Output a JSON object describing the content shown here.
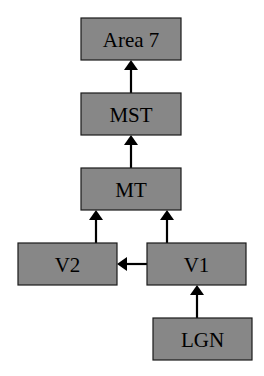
{
  "diagram": {
    "type": "flow",
    "title": "",
    "colors": {
      "node_fill": "#878787",
      "node_border": "#1a1a1a",
      "arrow": "#000000",
      "background": "#ffffff"
    },
    "nodes": [
      {
        "id": "area7",
        "label": "Area 7"
      },
      {
        "id": "mst",
        "label": "MST"
      },
      {
        "id": "mt",
        "label": "MT"
      },
      {
        "id": "v2",
        "label": "V2"
      },
      {
        "id": "v1",
        "label": "V1"
      },
      {
        "id": "lgn",
        "label": "LGN"
      }
    ],
    "edges": [
      {
        "from": "mst",
        "to": "area7"
      },
      {
        "from": "mt",
        "to": "mst"
      },
      {
        "from": "v2",
        "to": "mt"
      },
      {
        "from": "v1",
        "to": "mt"
      },
      {
        "from": "v1",
        "to": "v2"
      },
      {
        "from": "lgn",
        "to": "v1"
      }
    ]
  }
}
